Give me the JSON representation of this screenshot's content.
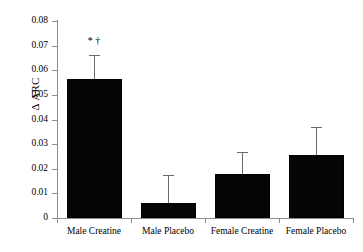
{
  "chart_data": {
    "type": "bar",
    "title": "",
    "subtitle": "",
    "xlabel": "",
    "ylabel": "Δ ARC",
    "categories": [
      "Male Creatine",
      "Male Placebo",
      "Female Creatine",
      "Female Placebo"
    ],
    "values": [
      0.0565,
      0.0062,
      0.0178,
      0.0255
    ],
    "errors": [
      0.0098,
      0.0113,
      0.009,
      0.0115
    ],
    "error_type": "upper-only",
    "annotations": [
      {
        "category": "Male Creatine",
        "text": "* †"
      }
    ],
    "ylim": [
      0,
      0.08
    ],
    "yticks": [
      0,
      0.01,
      0.02,
      0.03,
      0.04,
      0.05,
      0.06,
      0.07,
      0.08
    ],
    "ytick_labels": [
      "0",
      "0.01",
      "0.02",
      "0.03",
      "0.04",
      "0.05",
      "0.06",
      "0.07",
      "0.08"
    ],
    "grid": false,
    "legend": false,
    "legend_position": "none",
    "bar_color": "#050505",
    "axis_color": "#8e8e8e",
    "error_color": "#6b6b6b"
  },
  "axis": {
    "y_title": "Δ ARC",
    "ticks": [
      {
        "label": "0.08",
        "value": 0.08
      },
      {
        "label": "0.07",
        "value": 0.07
      },
      {
        "label": "0.06",
        "value": 0.06
      },
      {
        "label": "0.05",
        "value": 0.05
      },
      {
        "label": "0.04",
        "value": 0.04
      },
      {
        "label": "0.03",
        "value": 0.03
      },
      {
        "label": "0.02",
        "value": 0.02
      },
      {
        "label": "0.01",
        "value": 0.01
      },
      {
        "label": "0",
        "value": 0
      }
    ]
  },
  "bars": [
    {
      "label": "Male Creatine",
      "value": 0.0565,
      "error": 0.0098,
      "marker": "* †"
    },
    {
      "label": "Male Placebo",
      "value": 0.0062,
      "error": 0.0113,
      "marker": ""
    },
    {
      "label": "Female Creatine",
      "value": 0.0178,
      "error": 0.009,
      "marker": ""
    },
    {
      "label": "Female Placebo",
      "value": 0.0255,
      "error": 0.0115,
      "marker": ""
    }
  ]
}
